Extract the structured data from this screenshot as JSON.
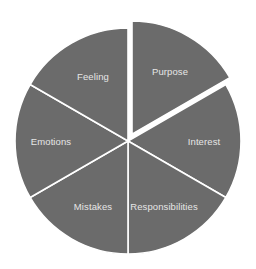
{
  "chart_data": {
    "type": "pie",
    "title": "",
    "categories": [
      "Purpose",
      "Interest",
      "Responsibilities",
      "Mistakes",
      "Emotions",
      "Feeling"
    ],
    "values": [
      1,
      1,
      1,
      1,
      1,
      1
    ],
    "exploded": [
      "Purpose"
    ],
    "start_angle_deg": 0,
    "direction": "clockwise",
    "fill_color": "#6b6b6b",
    "divider_color": "#ffffff",
    "legend": "none",
    "labels_inside": true
  },
  "labels": {
    "purpose": "Purpose",
    "interest": "Interest",
    "responsibilities": "Responsibilities",
    "mistakes": "Mistakes",
    "emotions": "Emotions",
    "feeling": "Feeling"
  }
}
